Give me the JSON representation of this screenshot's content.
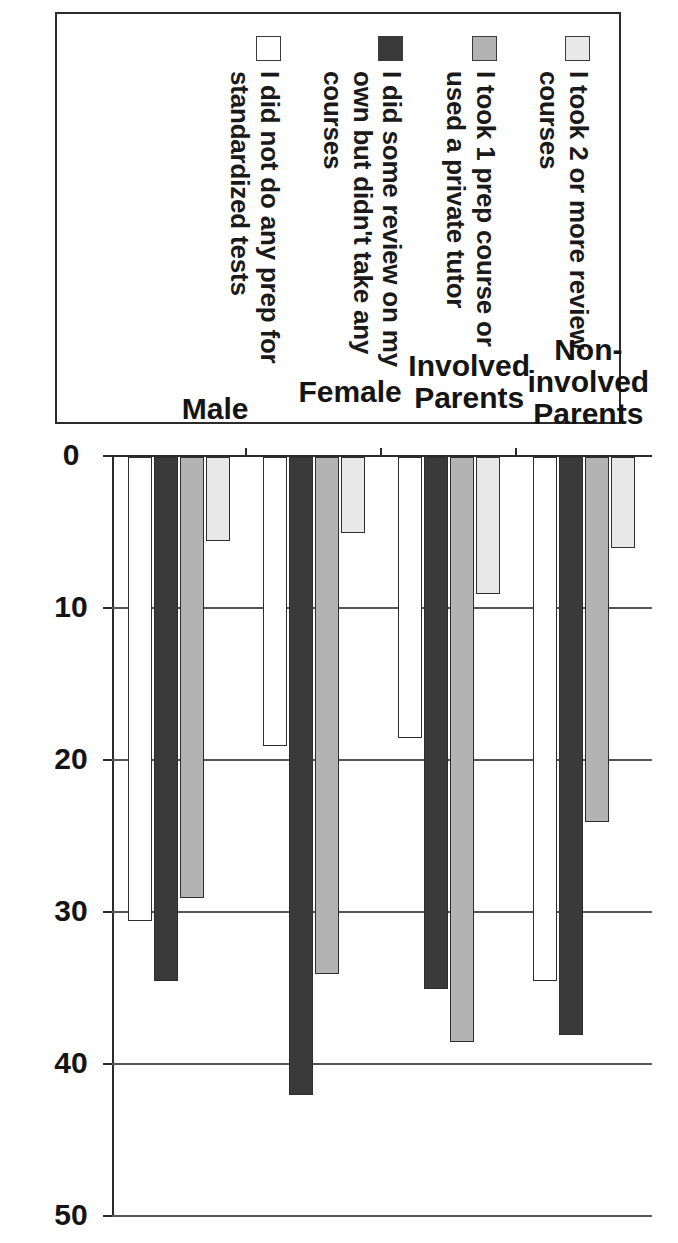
{
  "chart_data": {
    "type": "bar",
    "orientation": "vertical",
    "title": "",
    "subtitle": "",
    "xlabel": "",
    "ylabel": "",
    "ylim": [
      0,
      50
    ],
    "y_ticks": [
      0,
      10,
      20,
      30,
      40,
      50
    ],
    "grid": true,
    "grid_axis": "value",
    "legend_position": "top",
    "categories": [
      "Non-\ninvolved\nParents",
      "Involved\nParents",
      "Female",
      "Male"
    ],
    "series": [
      {
        "name": "I took 2 or more review courses",
        "color": "#e8e8e8",
        "values": [
          6,
          9,
          5,
          5.5
        ]
      },
      {
        "name": "I took 1 prep course or used a private tutor",
        "color": "#b3b3b3",
        "values": [
          24,
          38.5,
          34,
          29
        ]
      },
      {
        "name": "I did some review on my own but didn't take any courses",
        "color": "#3a3a3a",
        "values": [
          38,
          35,
          42,
          34.5
        ]
      },
      {
        "name": "I did not do any prep for standardized tests",
        "color": "#ffffff",
        "values": [
          34.5,
          18.5,
          19,
          30.5
        ]
      }
    ]
  },
  "legend": {
    "items": [
      {
        "label": "I took 2 or more review courses",
        "swatch_color": "#e8e8e8",
        "swatch_name": "legend-swatch-light-gray"
      },
      {
        "label": "I took 1 prep course or used a private tutor",
        "swatch_color": "#b3b3b3",
        "swatch_name": "legend-swatch-medium-gray"
      },
      {
        "label": "I did some review on my own but didn't take any courses",
        "swatch_color": "#3a3a3a",
        "swatch_name": "legend-swatch-dark"
      },
      {
        "label": "I did not do any prep for standardized tests",
        "swatch_color": "#ffffff",
        "swatch_name": "legend-swatch-white"
      }
    ]
  },
  "axis": {
    "tick_labels": [
      "0",
      "10",
      "20",
      "30",
      "40",
      "50"
    ]
  },
  "categories": {
    "labels": [
      "Non-\ninvolved\nParents",
      "Involved\nParents",
      "Female",
      "Male"
    ]
  },
  "colors": {
    "series_1": "#e8e8e8",
    "series_2": "#b3b3b3",
    "series_3": "#3a3a3a",
    "series_4": "#ffffff",
    "axis": "#2b2b2b",
    "grid": "#555555",
    "text": "#141414",
    "background": "#ffffff"
  }
}
